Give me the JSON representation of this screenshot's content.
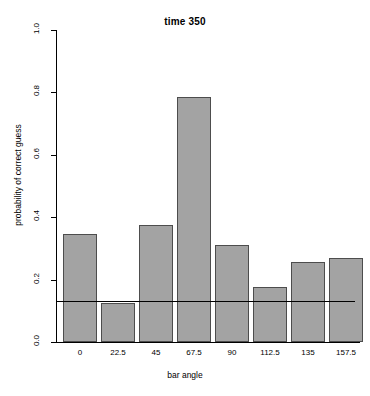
{
  "chart_data": {
    "type": "bar",
    "title": "time 350",
    "xlabel": "bar angle",
    "ylabel": "probability of correct guess",
    "categories": [
      "0",
      "22.5",
      "45",
      "67.5",
      "90",
      "112.5",
      "135",
      "157.5"
    ],
    "values": [
      0.345,
      0.125,
      0.375,
      0.785,
      0.312,
      0.175,
      0.258,
      0.268
    ],
    "ylim": [
      0.0,
      1.0
    ],
    "ytick_labels": [
      "0.0",
      "0.2",
      "0.4",
      "0.6",
      "0.8",
      "1.0"
    ],
    "ytick_values": [
      0.0,
      0.2,
      0.4,
      0.6,
      0.8,
      1.0
    ],
    "grid": false,
    "legend": "none",
    "annotations": [
      {
        "type": "horizontal-line",
        "name": "chance-level-line",
        "value": 0.133
      }
    ],
    "bar_fill_color": "#a3a3a3",
    "bar_border_color": "#4d4d4d",
    "axis_color": "#000000",
    "background_color": "#ffffff"
  }
}
